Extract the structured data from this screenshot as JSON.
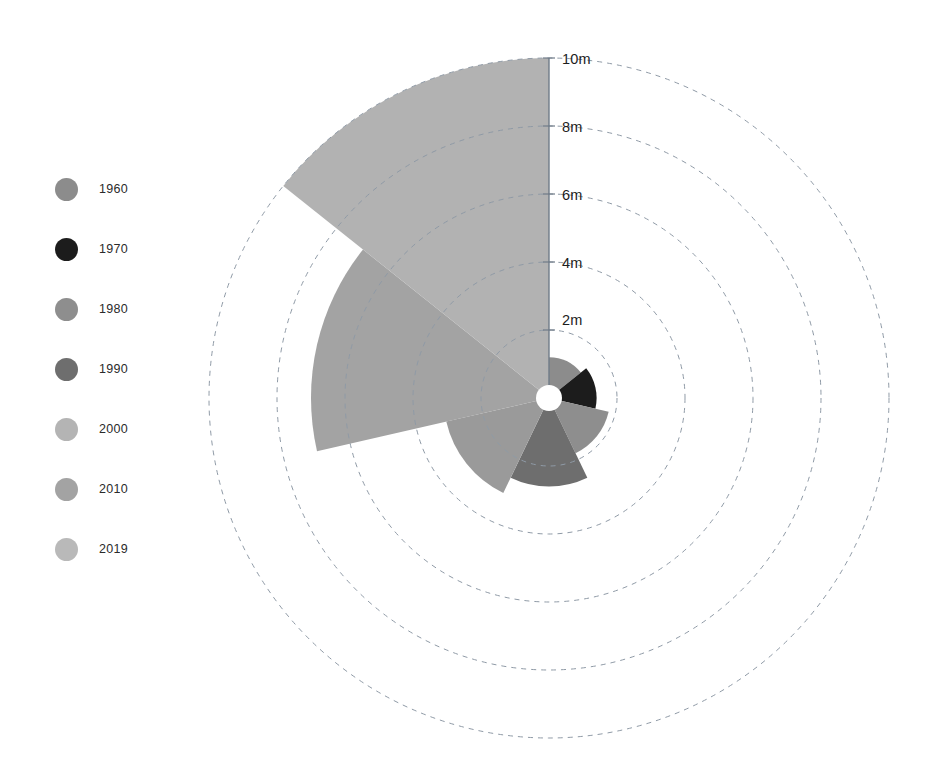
{
  "chart_data": {
    "type": "pie",
    "variant": "nightingale-rose-polar-area",
    "title": "",
    "subtitle": "",
    "xlabel": "",
    "ylabel": "",
    "unit": "m",
    "radial_axis": {
      "ticks": [
        2,
        4,
        6,
        8,
        10
      ],
      "tick_labels": [
        "2m",
        "4m",
        "6m",
        "8m",
        "10m"
      ],
      "rmin": 0,
      "rmax": 10,
      "grid": true,
      "grid_style": "dashed",
      "grid_color": "#8f9aa6",
      "axis_line_color": "#6f7b88"
    },
    "legend": {
      "position": "left",
      "entries": [
        {
          "label": "1960",
          "color": "#8c8c8c"
        },
        {
          "label": "1970",
          "color": "#1c1c1c"
        },
        {
          "label": "1980",
          "color": "#8e8e8e"
        },
        {
          "label": "1990",
          "color": "#6e6e6e"
        },
        {
          "label": "2000",
          "color": "#b4b4b4"
        },
        {
          "label": "2010",
          "color": "#a3a3a3"
        },
        {
          "label": "2019",
          "color": "#b9b9b9"
        }
      ]
    },
    "categories": [
      "1960",
      "1970",
      "1980",
      "1990",
      "2000",
      "2010",
      "2019"
    ],
    "values": [
      1.2,
      1.4,
      1.8,
      2.6,
      3.1,
      7.0,
      10.0
    ],
    "series": [
      {
        "name": "value",
        "values": [
          1.2,
          1.4,
          1.8,
          2.6,
          3.1,
          7.0,
          10.0
        ]
      }
    ],
    "wedges": [
      {
        "label": "1960",
        "value": 1.2,
        "color": "#8c8c8c",
        "start_deg": 0,
        "end_deg": 51.4
      },
      {
        "label": "1970",
        "value": 1.4,
        "color": "#1c1c1c",
        "start_deg": 51.4,
        "end_deg": 102.9
      },
      {
        "label": "1980",
        "value": 1.8,
        "color": "#8e8e8e",
        "start_deg": 102.9,
        "end_deg": 154.3
      },
      {
        "label": "1990",
        "value": 2.6,
        "color": "#6e6e6e",
        "start_deg": 154.3,
        "end_deg": 205.7
      },
      {
        "label": "2000",
        "value": 3.1,
        "color": "#9a9a9a",
        "start_deg": 205.7,
        "end_deg": 257.1
      },
      {
        "label": "2010",
        "value": 7.0,
        "color": "#a3a3a3",
        "start_deg": 257.1,
        "end_deg": 308.6
      },
      {
        "label": "2019",
        "value": 10.0,
        "color": "#b2b2b2",
        "start_deg": 308.6,
        "end_deg": 360
      }
    ],
    "center_hole": {
      "radius_px": 13,
      "color": "#ffffff"
    }
  },
  "geometry": {
    "cx": 549,
    "cy": 398,
    "px_per_unit": 34
  }
}
